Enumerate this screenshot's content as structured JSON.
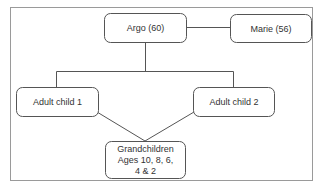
{
  "diagram": {
    "type": "family-tree",
    "nodes": {
      "argo": {
        "label": "Argo (60)"
      },
      "marie": {
        "label": "Marie (56)"
      },
      "child1": {
        "label": "Adult child 1"
      },
      "child2": {
        "label": "Adult child 2"
      },
      "grandchildren": {
        "line1": "Grandchildren",
        "line2": "Ages 10, 8, 6,",
        "line3": "4 & 2"
      }
    },
    "edges": [
      {
        "from": "argo",
        "to": "marie",
        "kind": "partner"
      },
      {
        "from": "argo",
        "to": "child1",
        "kind": "parent"
      },
      {
        "from": "argo",
        "to": "child2",
        "kind": "parent"
      },
      {
        "from": "child1",
        "to": "grandchildren",
        "kind": "parent"
      },
      {
        "from": "child2",
        "to": "grandchildren",
        "kind": "parent"
      }
    ]
  }
}
